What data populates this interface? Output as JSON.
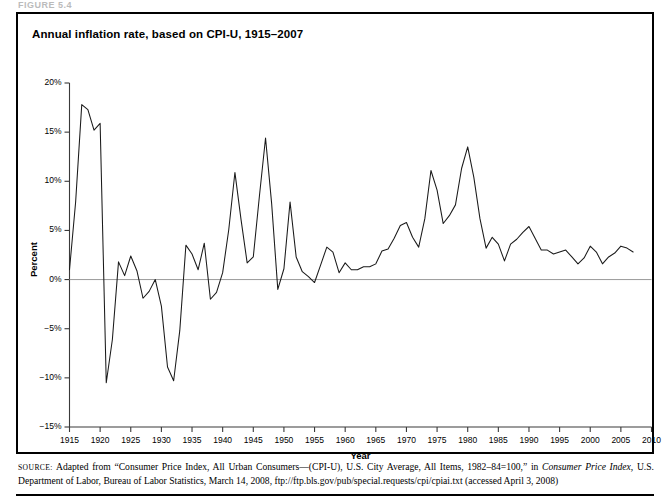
{
  "figure": {
    "label": "FIGURE 5.4"
  },
  "chart": {
    "title": "Annual inflation rate, based on CPI-U, 1915–2007"
  },
  "source": {
    "prefix": "SOURCE:",
    "text_before_italic": " Adapted from “Consumer Price Index, All Urban Consumers—(CPI-U), U.S. City Average, All Items, 1982–84=100,” in ",
    "italic_title": "Consumer Price Index,",
    "text_after_italic": " U.S. Department of Labor, Bureau of Labor Statistics, March 14, 2008, ftp://ftp.bls.gov/pub/special.requests/cpi/cpiai.txt (accessed April 3, 2008)"
  },
  "chart_data": {
    "type": "line",
    "title": "Annual inflation rate, based on CPI-U, 1915–2007",
    "xlabel": "Year",
    "ylabel": "Percent",
    "xlim": [
      1915,
      2010
    ],
    "ylim": [
      -15,
      20
    ],
    "xticks": [
      1915,
      1920,
      1925,
      1930,
      1935,
      1940,
      1945,
      1950,
      1955,
      1960,
      1965,
      1970,
      1975,
      1980,
      1985,
      1990,
      1995,
      2000,
      2005,
      2010
    ],
    "xtick_labels": [
      "1915",
      "1920",
      "1925",
      "1930",
      "1935",
      "1940",
      "1945",
      "1950",
      "1955",
      "1960",
      "1965",
      "1970",
      "1975",
      "1980",
      "1985",
      "1990",
      "1995",
      "2000",
      "2005",
      "2010"
    ],
    "yticks": [
      -15,
      -10,
      -5,
      0,
      5,
      10,
      15,
      20
    ],
    "ytick_labels": [
      "−15%",
      "−10%",
      "−5%",
      "0%",
      "5%",
      "10%",
      "15%",
      "20%"
    ],
    "grid": false,
    "zero_line": true,
    "legend": "none",
    "line_color": "#1a1a1a",
    "zero_line_color": "#9a9a9a",
    "series": [
      {
        "name": "Annual inflation rate (CPI-U)",
        "x": [
          1915,
          1916,
          1917,
          1918,
          1919,
          1920,
          1921,
          1922,
          1923,
          1924,
          1925,
          1926,
          1927,
          1928,
          1929,
          1930,
          1931,
          1932,
          1933,
          1934,
          1935,
          1936,
          1937,
          1938,
          1939,
          1940,
          1941,
          1942,
          1943,
          1944,
          1945,
          1946,
          1947,
          1948,
          1949,
          1950,
          1951,
          1952,
          1953,
          1954,
          1955,
          1956,
          1957,
          1958,
          1959,
          1960,
          1961,
          1962,
          1963,
          1964,
          1965,
          1966,
          1967,
          1968,
          1969,
          1970,
          1971,
          1972,
          1973,
          1974,
          1975,
          1976,
          1977,
          1978,
          1979,
          1980,
          1981,
          1982,
          1983,
          1984,
          1985,
          1986,
          1987,
          1988,
          1989,
          1990,
          1991,
          1992,
          1993,
          1994,
          1995,
          1996,
          1997,
          1998,
          1999,
          2000,
          2001,
          2002,
          2003,
          2004,
          2005,
          2006,
          2007
        ],
        "values": [
          1.0,
          7.9,
          17.8,
          17.3,
          15.2,
          15.9,
          -10.5,
          -6.1,
          1.8,
          0.4,
          2.4,
          0.9,
          -1.9,
          -1.2,
          0.0,
          -2.7,
          -8.9,
          -10.3,
          -5.2,
          3.5,
          2.6,
          1.0,
          3.7,
          -2.0,
          -1.3,
          0.7,
          5.1,
          10.9,
          6.1,
          1.7,
          2.3,
          8.5,
          14.4,
          7.7,
          -1.0,
          1.1,
          7.9,
          2.3,
          0.8,
          0.3,
          -0.3,
          1.5,
          3.3,
          2.8,
          0.7,
          1.7,
          1.0,
          1.0,
          1.3,
          1.3,
          1.6,
          2.9,
          3.1,
          4.2,
          5.5,
          5.8,
          4.3,
          3.3,
          6.2,
          11.1,
          9.1,
          5.7,
          6.5,
          7.6,
          11.3,
          13.5,
          10.4,
          6.2,
          3.2,
          4.3,
          3.6,
          1.9,
          3.6,
          4.1,
          4.8,
          5.4,
          4.2,
          3.0,
          3.0,
          2.6,
          2.8,
          3.0,
          2.3,
          1.6,
          2.2,
          3.4,
          2.8,
          1.6,
          2.3,
          2.7,
          3.4,
          3.2,
          2.8
        ]
      }
    ]
  }
}
